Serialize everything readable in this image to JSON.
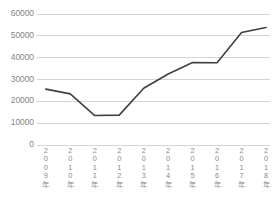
{
  "chart_data": {
    "type": "line",
    "title": "",
    "subtitle": "",
    "xlabel": "",
    "ylabel": "",
    "categories": [
      "2009年",
      "2010年",
      "2011年",
      "2012年",
      "2013年",
      "2014年",
      "2015年",
      "2016年",
      "2017年",
      "2018年"
    ],
    "values": [
      25600,
      23400,
      13500,
      13700,
      26000,
      32500,
      37800,
      37700,
      51500,
      53800
    ],
    "series": [
      {
        "name": "",
        "values": [
          25600,
          23400,
          13500,
          13700,
          26000,
          32500,
          37800,
          37700,
          51500,
          53800
        ]
      }
    ],
    "ylim": [
      0,
      60000
    ],
    "yticks": [
      0,
      10000,
      20000,
      30000,
      40000,
      50000,
      60000
    ],
    "ytick_labels": [
      "0",
      "10000",
      "20000",
      "30000",
      "40000",
      "50000",
      "60000"
    ],
    "grid": true,
    "grid_axis": "y",
    "legend": false,
    "legend_position": "none",
    "annotations": [],
    "colors": {
      "line": "#404040",
      "grid": "#d4d4d4",
      "tick_label": "#858585",
      "background": "#ffffff"
    },
    "line_width": 1.6,
    "markers": false
  }
}
